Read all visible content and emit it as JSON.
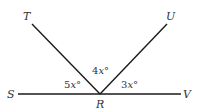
{
  "diagram": {
    "type": "angles-on-a-line",
    "points": {
      "S": {
        "label": "S"
      },
      "T": {
        "label": "T"
      },
      "U": {
        "label": "U"
      },
      "V": {
        "label": "V"
      },
      "R": {
        "label": "R"
      }
    },
    "segments": [
      "SV",
      "RT",
      "RU"
    ],
    "angles": {
      "SRT": {
        "coef": "5",
        "var": "x",
        "unit": "°"
      },
      "TRU": {
        "coef": "4",
        "var": "x",
        "unit": "°"
      },
      "URV": {
        "coef": "3",
        "var": "x",
        "unit": "°"
      }
    },
    "colors": {
      "line": "#1a1a1a",
      "text": "#333333",
      "background": "#ffffff"
    }
  }
}
